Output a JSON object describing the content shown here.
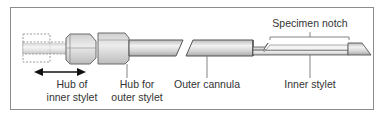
{
  "diagram": {
    "type": "biopsy needle schematic",
    "labels": {
      "hub_inner": [
        "Hub of",
        "inner stylet"
      ],
      "hub_outer": [
        "Hub for",
        "outer stylet"
      ],
      "outer_cannula": "Outer cannula",
      "inner_stylet": "Inner stylet",
      "specimen_notch": "Specimen notch"
    },
    "colors": {
      "frame": "#8c8c8c",
      "metal_light": "#e6e6e6",
      "metal_mid": "#c8c8c8",
      "metal_dark": "#9a9a9a",
      "outline": "#4d4d4d",
      "text": "#333333"
    }
  }
}
